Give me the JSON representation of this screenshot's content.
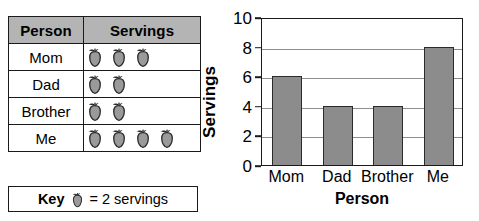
{
  "table": {
    "headers": [
      "Person",
      "Servings"
    ],
    "rows": [
      {
        "person": "Mom",
        "apples": 3
      },
      {
        "person": "Dad",
        "apples": 2
      },
      {
        "person": "Brother",
        "apples": 2
      },
      {
        "person": "Me",
        "apples": 4
      }
    ],
    "icon": "apple-icon"
  },
  "key": {
    "label": "Key",
    "icon": "apple-icon",
    "equals_text": "= 2 servings",
    "value_per_icon": 2
  },
  "colors": {
    "header_fill": "#b4b4b4",
    "bar_fill": "#8c8c8c",
    "bar_stroke": "#2b2b2b",
    "apple_fill": "#9a9a9a",
    "apple_stroke": "#2b2b2b",
    "axis": "#1a1a1a",
    "gridline": "#8e8e8e"
  },
  "chart_data": {
    "type": "bar",
    "title": "",
    "categories": [
      "Mom",
      "Dad",
      "Brother",
      "Me"
    ],
    "values": [
      6,
      4,
      4,
      8
    ],
    "xlabel": "Person",
    "ylabel": "Servings",
    "ylim": [
      0,
      10
    ],
    "yticks": [
      0,
      2,
      4,
      6,
      8,
      10
    ],
    "grid": true,
    "legend": "none"
  }
}
